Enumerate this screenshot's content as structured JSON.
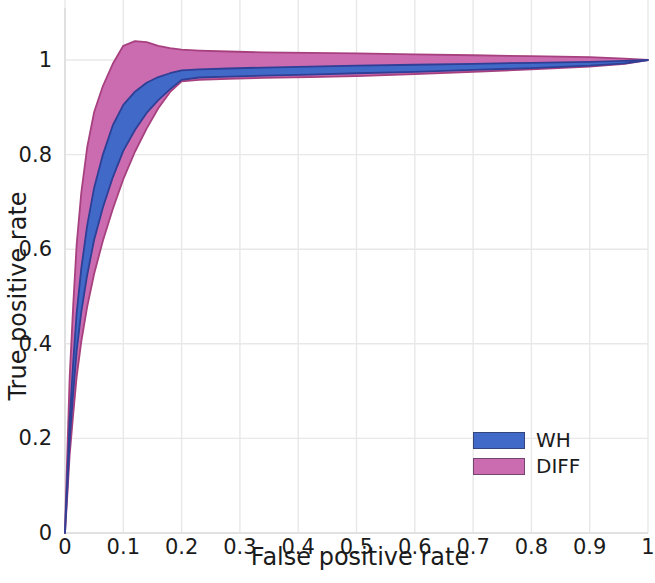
{
  "chart_data": {
    "type": "area",
    "title": "",
    "xlabel": "False positive rate",
    "ylabel": "True positive rate",
    "xlim": [
      0,
      1
    ],
    "ylim": [
      0,
      1.06
    ],
    "grid": true,
    "legend_position": "lower right",
    "xticks": [
      "0",
      "0.1",
      "0.2",
      "0.3",
      "0.4",
      "0.5",
      "0.6",
      "0.7",
      "0.8",
      "0.9",
      "1"
    ],
    "xtick_values": [
      0,
      0.1,
      0.2,
      0.3,
      0.4,
      0.5,
      0.6,
      0.7,
      0.8,
      0.9,
      1
    ],
    "yticks": [
      "0",
      "0.2",
      "0.4",
      "0.6",
      "0.8",
      "1"
    ],
    "ytick_values": [
      0,
      0.2,
      0.4,
      0.6,
      0.8,
      1
    ],
    "series": [
      {
        "name": "WH",
        "color": "#4169c8",
        "edge_color": "#2f3f96",
        "x": [
          0.0,
          0.004,
          0.008,
          0.014,
          0.02,
          0.028,
          0.038,
          0.05,
          0.065,
          0.082,
          0.1,
          0.12,
          0.14,
          0.16,
          0.18,
          0.2,
          0.23,
          0.28,
          0.34,
          0.42,
          0.5,
          0.6,
          0.7,
          0.8,
          0.9,
          0.96,
          1.0
        ],
        "upper": [
          0.005,
          0.12,
          0.24,
          0.36,
          0.465,
          0.56,
          0.65,
          0.73,
          0.8,
          0.862,
          0.905,
          0.933,
          0.952,
          0.964,
          0.972,
          0.978,
          0.98,
          0.982,
          0.984,
          0.986,
          0.988,
          0.99,
          0.992,
          0.994,
          0.996,
          0.998,
          1.0
        ],
        "lower": [
          0.0,
          0.095,
          0.195,
          0.295,
          0.385,
          0.468,
          0.545,
          0.62,
          0.688,
          0.752,
          0.808,
          0.852,
          0.888,
          0.915,
          0.938,
          0.958,
          0.963,
          0.965,
          0.967,
          0.969,
          0.972,
          0.975,
          0.979,
          0.983,
          0.988,
          0.993,
          1.0
        ]
      },
      {
        "name": "DIFF",
        "color": "#cc6cb0",
        "edge_color": "#a6407f",
        "x": [
          0.0,
          0.004,
          0.008,
          0.014,
          0.02,
          0.028,
          0.038,
          0.05,
          0.065,
          0.082,
          0.1,
          0.12,
          0.14,
          0.16,
          0.18,
          0.2,
          0.23,
          0.28,
          0.34,
          0.42,
          0.5,
          0.6,
          0.7,
          0.8,
          0.9,
          0.96,
          1.0
        ],
        "upper": [
          0.01,
          0.17,
          0.33,
          0.48,
          0.61,
          0.72,
          0.815,
          0.89,
          0.945,
          0.992,
          1.03,
          1.04,
          1.038,
          1.03,
          1.025,
          1.022,
          1.02,
          1.018,
          1.016,
          1.015,
          1.014,
          1.012,
          1.01,
          1.008,
          1.006,
          1.003,
          1.0
        ],
        "lower": [
          0.0,
          0.08,
          0.165,
          0.25,
          0.33,
          0.405,
          0.478,
          0.548,
          0.618,
          0.685,
          0.748,
          0.806,
          0.855,
          0.898,
          0.932,
          0.955,
          0.958,
          0.96,
          0.962,
          0.964,
          0.966,
          0.97,
          0.975,
          0.98,
          0.986,
          0.992,
          1.0
        ]
      }
    ]
  },
  "axis": {
    "x_title": "False positive rate",
    "y_title": "True positive rate"
  },
  "legend": {
    "entries": [
      {
        "label": "WH",
        "color": "#4169c8"
      },
      {
        "label": "DIFF",
        "color": "#cc6cb0"
      }
    ]
  },
  "colors": {
    "wh": "#4169c8",
    "diff": "#cc6cb0",
    "grid": "#e8e8e8",
    "text": "#1b1b1b",
    "background": "#ffffff"
  }
}
